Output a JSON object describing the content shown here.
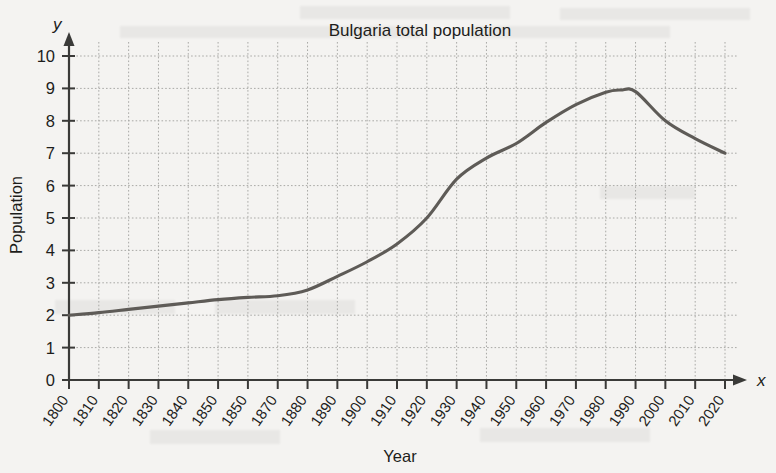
{
  "chart_data": {
    "type": "line",
    "title": "Bulgaria total population",
    "xlabel": "Year",
    "ylabel": "Population",
    "axis_symbol_x": "x",
    "axis_symbol_y": "y",
    "xlim": [
      1800,
      2020
    ],
    "ylim": [
      0,
      10
    ],
    "grid": true,
    "legend": "none",
    "curve_color": "#5e5b57",
    "grid_color": "#a9a9a6",
    "axis_color": "#3a3a38",
    "background_color": "#f4f3f1",
    "y_ticks": [
      "0",
      "1",
      "2",
      "3",
      "4",
      "5",
      "6",
      "7",
      "8",
      "9",
      "10"
    ],
    "x_tick_labels": [
      "1800",
      "1810",
      "1820",
      "1830",
      "1840",
      "1850",
      "1850",
      "1870",
      "1880",
      "1890",
      "1900",
      "1910",
      "1920",
      "1930",
      "1940",
      "1950",
      "1960",
      "1970",
      "1980",
      "1990",
      "2000",
      "2010",
      "2020"
    ],
    "x_tick_note": "Seventh label printed as 1850 (duplicate); position corresponds to 1860.",
    "x": [
      1800,
      1810,
      1820,
      1830,
      1840,
      1850,
      1860,
      1870,
      1880,
      1890,
      1900,
      1910,
      1920,
      1930,
      1940,
      1950,
      1960,
      1970,
      1980,
      1985,
      1990,
      2000,
      2010,
      2020
    ],
    "values": [
      2.0,
      2.08,
      2.18,
      2.28,
      2.38,
      2.48,
      2.55,
      2.6,
      2.78,
      3.2,
      3.65,
      4.2,
      5.0,
      6.2,
      6.85,
      7.3,
      7.95,
      8.5,
      8.88,
      8.95,
      8.9,
      8.0,
      7.45,
      7.0
    ],
    "series": [
      {
        "name": "Bulgaria total population",
        "values": [
          2.0,
          2.08,
          2.18,
          2.28,
          2.38,
          2.48,
          2.55,
          2.6,
          2.78,
          3.2,
          3.65,
          4.2,
          5.0,
          6.2,
          6.85,
          7.3,
          7.95,
          8.5,
          8.88,
          8.95,
          8.9,
          8.0,
          7.45,
          7.0
        ]
      }
    ]
  }
}
